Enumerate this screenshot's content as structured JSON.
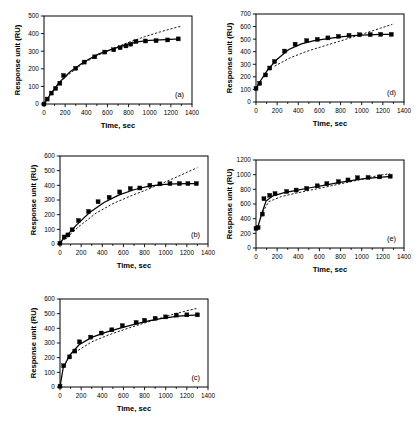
{
  "figure": {
    "axis_titles": {
      "x": "Time, sec",
      "y": "Response unit (RU)"
    },
    "panel_labels": {
      "a": "(a)",
      "b": "(b)",
      "c": "(c)",
      "d": "(d)",
      "e": "(e)"
    }
  },
  "chart_data": [
    {
      "id": "a",
      "label": "(a)",
      "type": "scatter",
      "title": "",
      "xlabel": "Time, sec",
      "ylabel": "Response unit (RU)",
      "xlim": [
        0,
        1400
      ],
      "ylim": [
        0,
        500
      ],
      "xticks": [
        0,
        200,
        400,
        600,
        800,
        1000,
        1200,
        1400
      ],
      "yticks": [
        0,
        100,
        200,
        300,
        400,
        500
      ],
      "grid": false,
      "legend": "none",
      "series": [
        {
          "name": "measured response",
          "style": "squares",
          "x": [
            0,
            30,
            70,
            110,
            150,
            185,
            300,
            380,
            480,
            575,
            660,
            720,
            775,
            820,
            870,
            960,
            1060,
            1170,
            1270
          ],
          "y": [
            0,
            28,
            62,
            88,
            118,
            162,
            203,
            238,
            268,
            295,
            308,
            320,
            330,
            340,
            355,
            358,
            360,
            364,
            370
          ]
        },
        {
          "name": "fit (solid)",
          "style": "solid-line",
          "x": [
            0,
            60,
            140,
            250,
            380,
            520,
            660,
            800,
            900,
            1000,
            1150,
            1280
          ],
          "y": [
            0,
            55,
            120,
            185,
            240,
            285,
            315,
            340,
            355,
            362,
            366,
            370
          ]
        },
        {
          "name": "model (dashed)",
          "style": "dashed-line",
          "x": [
            80,
            200,
            350,
            500,
            650,
            800,
            950,
            1100,
            1250,
            1300
          ],
          "y": [
            70,
            152,
            222,
            275,
            315,
            350,
            382,
            410,
            435,
            442
          ]
        }
      ]
    },
    {
      "id": "b",
      "label": "(b)",
      "type": "scatter",
      "title": "",
      "xlabel": "Time, sec",
      "ylabel": "Response unit (RU)",
      "xlim": [
        0,
        1400
      ],
      "ylim": [
        0,
        600
      ],
      "xticks": [
        0,
        200,
        400,
        600,
        800,
        1000,
        1200,
        1400
      ],
      "yticks": [
        0,
        100,
        200,
        300,
        400,
        500,
        600
      ],
      "grid": false,
      "legend": "none",
      "series": [
        {
          "name": "measured response",
          "style": "squares",
          "x": [
            0,
            40,
            75,
            115,
            175,
            270,
            360,
            465,
            565,
            665,
            755,
            850,
            945,
            1040,
            1130,
            1210,
            1290
          ],
          "y": [
            5,
            48,
            62,
            97,
            160,
            222,
            288,
            318,
            355,
            378,
            382,
            400,
            410,
            412,
            412,
            412,
            412
          ]
        },
        {
          "name": "fit (solid)",
          "style": "solid-line",
          "x": [
            0,
            60,
            150,
            280,
            420,
            560,
            700,
            840,
            960,
            1080,
            1200,
            1300
          ],
          "y": [
            10,
            55,
            125,
            215,
            285,
            335,
            370,
            395,
            405,
            410,
            412,
            412
          ]
        },
        {
          "name": "model (dashed)",
          "style": "dashed-line",
          "x": [
            40,
            180,
            340,
            500,
            660,
            820,
            980,
            1120,
            1260,
            1300
          ],
          "y": [
            28,
            120,
            210,
            275,
            325,
            370,
            418,
            462,
            508,
            520
          ]
        }
      ]
    },
    {
      "id": "c",
      "label": "(c)",
      "type": "scatter",
      "title": "",
      "xlabel": "Time, sec",
      "ylabel": "Response unit (RU)",
      "xlim": [
        0,
        1400
      ],
      "ylim": [
        0,
        600
      ],
      "xticks": [
        0,
        200,
        400,
        600,
        800,
        1000,
        1200,
        1400
      ],
      "yticks": [
        0,
        100,
        200,
        300,
        400,
        500,
        600
      ],
      "grid": false,
      "legend": "none",
      "series": [
        {
          "name": "measured response",
          "style": "squares",
          "x": [
            0,
            35,
            90,
            140,
            185,
            290,
            390,
            490,
            590,
            720,
            800,
            900,
            1000,
            1100,
            1200,
            1300
          ],
          "y": [
            5,
            145,
            205,
            245,
            308,
            340,
            368,
            390,
            418,
            440,
            455,
            468,
            478,
            490,
            492,
            492
          ]
        },
        {
          "name": "fit (solid)",
          "style": "solid-line",
          "x": [
            0,
            30,
            90,
            180,
            300,
            430,
            570,
            710,
            850,
            980,
            1120,
            1300
          ],
          "y": [
            0,
            130,
            215,
            288,
            338,
            372,
            402,
            428,
            452,
            470,
            484,
            492
          ]
        },
        {
          "name": "model (dashed)",
          "style": "dashed-line",
          "x": [
            140,
            300,
            460,
            620,
            780,
            930,
            1080,
            1200,
            1290
          ],
          "y": [
            235,
            308,
            355,
            395,
            432,
            465,
            498,
            520,
            535
          ]
        }
      ]
    },
    {
      "id": "d",
      "label": "(d)",
      "type": "scatter",
      "title": "",
      "xlabel": "Time, sec",
      "ylabel": "Response unit (RU)",
      "xlim": [
        0,
        1400
      ],
      "ylim": [
        0,
        700
      ],
      "xticks": [
        0,
        200,
        400,
        600,
        800,
        1000,
        1200,
        1400
      ],
      "yticks": [
        0,
        100,
        200,
        300,
        400,
        500,
        600,
        700
      ],
      "grid": false,
      "legend": "none",
      "series": [
        {
          "name": "measured response",
          "style": "squares",
          "x": [
            0,
            35,
            90,
            130,
            175,
            270,
            370,
            480,
            580,
            680,
            780,
            880,
            980,
            1080,
            1180,
            1280
          ],
          "y": [
            108,
            148,
            215,
            270,
            322,
            405,
            460,
            488,
            498,
            510,
            522,
            530,
            535,
            536,
            538,
            538
          ]
        },
        {
          "name": "fit (solid)",
          "style": "solid-line",
          "x": [
            0,
            40,
            110,
            200,
            310,
            430,
            550,
            680,
            800,
            920,
            1050,
            1180,
            1290
          ],
          "y": [
            105,
            165,
            255,
            340,
            418,
            462,
            488,
            505,
            518,
            528,
            534,
            537,
            538
          ]
        },
        {
          "name": "model (dashed)",
          "style": "dashed-line",
          "x": [
            175,
            320,
            470,
            620,
            770,
            910,
            1050,
            1180,
            1290
          ],
          "y": [
            285,
            350,
            400,
            440,
            478,
            515,
            552,
            588,
            618
          ]
        }
      ]
    },
    {
      "id": "e",
      "label": "(e)",
      "type": "scatter",
      "title": "",
      "xlabel": "Time, sec",
      "ylabel": "Response unit (RU)",
      "xlim": [
        0,
        1400
      ],
      "ylim": [
        0,
        1200
      ],
      "xticks": [
        0,
        200,
        400,
        600,
        800,
        1000,
        1200,
        1400
      ],
      "yticks": [
        0,
        200,
        400,
        600,
        800,
        1000,
        1200
      ],
      "grid": false,
      "legend": "none",
      "series": [
        {
          "name": "measured response",
          "style": "squares",
          "x": [
            0,
            20,
            60,
            75,
            130,
            180,
            290,
            380,
            480,
            580,
            670,
            780,
            870,
            960,
            1060,
            1170,
            1270
          ],
          "y": [
            268,
            278,
            462,
            672,
            718,
            742,
            770,
            790,
            812,
            848,
            878,
            905,
            928,
            958,
            962,
            970,
            978
          ]
        },
        {
          "name": "fit (solid)",
          "style": "solid-line",
          "x": [
            0,
            20,
            55,
            95,
            160,
            260,
            380,
            500,
            640,
            780,
            900,
            1030,
            1160,
            1280
          ],
          "y": [
            262,
            300,
            470,
            640,
            712,
            752,
            785,
            818,
            855,
            890,
            918,
            945,
            962,
            978
          ]
        },
        {
          "name": "model (dashed)",
          "style": "dashed-line",
          "x": [
            45,
            120,
            240,
            380,
            520,
            660,
            800,
            930,
            1060,
            1180,
            1270
          ],
          "y": [
            440,
            632,
            702,
            748,
            790,
            832,
            875,
            915,
            958,
            995,
            1012
          ]
        }
      ]
    }
  ]
}
